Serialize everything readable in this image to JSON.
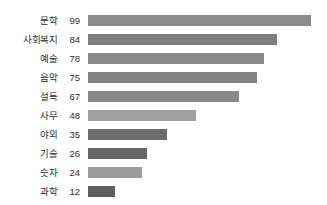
{
  "chart_data": {
    "type": "bar",
    "orientation": "horizontal",
    "title": "",
    "subtitle": "",
    "xlabel": "",
    "ylabel": "",
    "xlim": [
      0,
      99
    ],
    "grid": false,
    "legend": null,
    "value_labels_shown": true,
    "categories": [
      "문학",
      "사회복지",
      "예술",
      "음악",
      "설득",
      "사무",
      "야외",
      "기술",
      "숫자",
      "과학"
    ],
    "values": [
      99,
      84,
      78,
      75,
      67,
      48,
      35,
      26,
      24,
      12
    ],
    "bar_colors": [
      "#8c8c8c",
      "#7e7e7e",
      "#8a8a8a",
      "#828282",
      "#888888",
      "#a0a0a0",
      "#6e6e6e",
      "#666666",
      "#9c9c9c",
      "#5f5f5f"
    ],
    "rows": [
      {
        "category": "문학",
        "value": 99,
        "color": "#8c8c8c"
      },
      {
        "category": "사회복지",
        "value": 84,
        "color": "#7e7e7e"
      },
      {
        "category": "예술",
        "value": 78,
        "color": "#8a8a8a"
      },
      {
        "category": "음악",
        "value": 75,
        "color": "#828282"
      },
      {
        "category": "설득",
        "value": 67,
        "color": "#888888"
      },
      {
        "category": "사무",
        "value": 48,
        "color": "#a0a0a0"
      },
      {
        "category": "야외",
        "value": 35,
        "color": "#6e6e6e"
      },
      {
        "category": "기술",
        "value": 26,
        "color": "#666666"
      },
      {
        "category": "숫자",
        "value": 24,
        "color": "#9c9c9c"
      },
      {
        "category": "과학",
        "value": 12,
        "color": "#5f5f5f"
      }
    ]
  },
  "style": {
    "background": "#ffffff",
    "text_color": "#2b2b2b"
  }
}
